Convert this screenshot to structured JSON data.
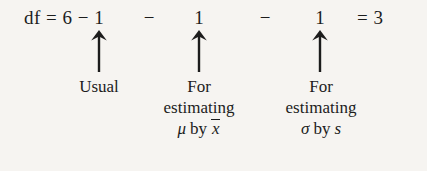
{
  "figure": {
    "name": "degrees-of-freedom-breakdown",
    "background_color": "#f6f4f1",
    "text_color": "#1c1c1c"
  },
  "equation": {
    "full_text": "df = 6 − 1 − 1 − 1 = 3",
    "lhs": "df = 6 − 1",
    "minus_1": "−",
    "one_1": "1",
    "minus_2": "−",
    "one_2": "1",
    "rhs": "= 3",
    "values": {
      "n": 6,
      "subtract_usual": 1,
      "subtract_mean_estimate": 1,
      "subtract_sd_estimate": 1,
      "df_result": 3
    }
  },
  "arrows": [
    {
      "name": "arrow-usual",
      "points_to": "Usual"
    },
    {
      "name": "arrow-mu",
      "points_to": "For estimating μ by x̄"
    },
    {
      "name": "arrow-sigma",
      "points_to": "For estimating σ by s"
    }
  ],
  "labels": {
    "usual": {
      "line1": "Usual"
    },
    "mu": {
      "line1": "For",
      "line2": "estimating",
      "parameter": "μ",
      "by": "by",
      "estimator": "x"
    },
    "sigma": {
      "line1": "For",
      "line2": "estimating",
      "parameter": "σ",
      "by": "by",
      "estimator": "s"
    }
  }
}
